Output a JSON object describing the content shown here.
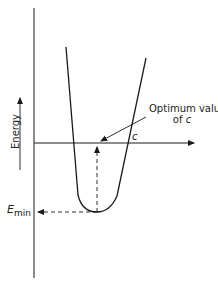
{
  "diagram": {
    "type": "energy-vs-parameter curve",
    "y_axis_label": "Energy",
    "annotation_optimum_line1": "Optimum value",
    "annotation_optimum_line2_prefix": "of ",
    "annotation_optimum_variable": "c",
    "parameter_symbol": "c",
    "min_label_main": "E",
    "min_label_sub": "min",
    "colors": {
      "ink": "#1a1a1a",
      "background": "#ffffff"
    }
  }
}
